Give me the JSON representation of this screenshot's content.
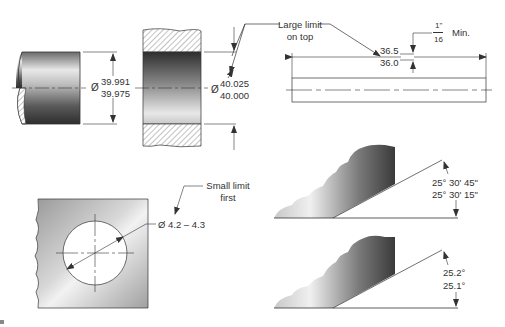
{
  "figure": {
    "shaft": {
      "diameter_symbol": "Ø",
      "upper_limit": "39.991",
      "lower_limit": "39.975"
    },
    "hole_part": {
      "diameter_symbol": "Ø",
      "upper_limit": "40.025",
      "lower_limit": "40.000"
    },
    "callout_large_limit": {
      "line1": "Large limit",
      "line2": "on top"
    },
    "bar_length": {
      "upper_limit": "36.5",
      "lower_limit": "36.0",
      "gap_numerator": "1\"",
      "gap_denominator": "16",
      "gap_suffix": "Min."
    },
    "plate_hole": {
      "callout_line1": "Small limit",
      "callout_line2": "first",
      "dimension": "Ø 4.2 – 4.3"
    },
    "angle_dms": {
      "upper_limit": "25° 30' 45\"",
      "lower_limit": "25° 30' 15\""
    },
    "angle_decimal": {
      "upper_limit": "25.2°",
      "lower_limit": "25.1°"
    }
  },
  "colors": {
    "line": "#333333",
    "hatch": "#666666",
    "metal_dark": "#3a3a3a",
    "metal_light": "#f0f0f0"
  }
}
